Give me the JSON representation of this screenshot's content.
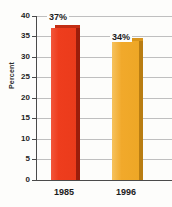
{
  "chart_data": {
    "type": "bar",
    "title": "",
    "xlabel": "",
    "ylabel": "Percent",
    "categories": [
      "1985",
      "1996"
    ],
    "values": [
      37,
      34
    ],
    "data_labels": [
      "37%",
      "34%"
    ],
    "ylim": [
      0,
      40
    ],
    "yticks": [
      0,
      5,
      10,
      15,
      20,
      25,
      30,
      35,
      40
    ],
    "ytick_labels": [
      "0",
      "5",
      "10",
      "15",
      "20",
      "25",
      "30",
      "35",
      "40"
    ],
    "grid": true,
    "legend": "none",
    "series": [
      {
        "name": "Percent",
        "values": [
          37,
          34
        ],
        "colors": [
          "#ee3d1d",
          "#eea726"
        ]
      }
    ],
    "colors": {
      "bar_1985": "#ee3d1d",
      "bar_1985_shadow": "#9c1d0b",
      "bar_1996": "#eea726",
      "bar_1996_shadow": "#b97d12",
      "gridline": "#bfbfbf",
      "axis": "#4a4a4a",
      "text": "#1b1b1b",
      "background": "#fdfdfb"
    }
  }
}
